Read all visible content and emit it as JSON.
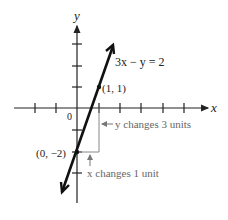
{
  "axes": {
    "x_label": "x",
    "y_label": "y",
    "origin_label": "0"
  },
  "equation": "3x − y = 2",
  "points": [
    {
      "label": "(1, 1)",
      "x": 1,
      "y": 1
    },
    {
      "label": "(0, −2)",
      "x": 0,
      "y": -2
    }
  ],
  "annotations": {
    "y_change": "y changes 3 units",
    "x_change": "x changes 1 unit"
  },
  "colors": {
    "line": "#111111",
    "axis": "#222222",
    "annotation": "#777777"
  }
}
